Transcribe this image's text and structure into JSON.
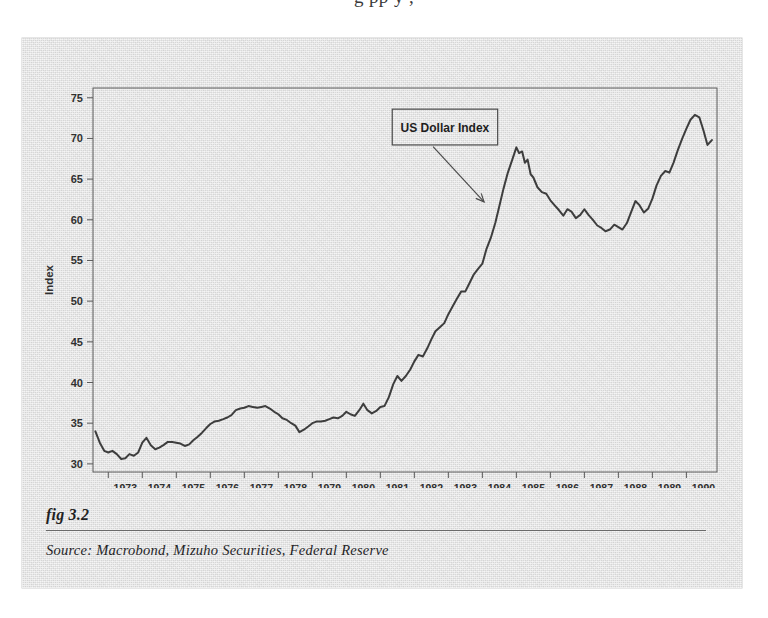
{
  "page": {
    "top_text_fragment": "g           pp y        ,"
  },
  "figure": {
    "fig_number": "fig 3.2",
    "source": "Source:  Macrobond, Mizuho Securities, Federal Reserve"
  },
  "chart_data": {
    "type": "line",
    "title": "",
    "annotation": {
      "label": "US Dollar Index",
      "box_x": 1981.35,
      "box_y_top": 73.6,
      "box_y_bottom": 69.2,
      "box_x_end": 1984.45,
      "arrow_from_x": 1982.55,
      "arrow_from_y": 69.0,
      "arrow_to_x": 1984.05,
      "arrow_to_y": 62.2
    },
    "xlabel": "",
    "ylabel": "Index",
    "xlim": [
      1972.55,
      1990.9
    ],
    "ylim": [
      29.0,
      76.2
    ],
    "yticks": [
      30,
      35,
      40,
      45,
      50,
      55,
      60,
      65,
      70,
      75
    ],
    "xticks": [
      1973,
      1974,
      1975,
      1976,
      1977,
      1978,
      1979,
      1980,
      1981,
      1982,
      1983,
      1984,
      1985,
      1986,
      1987,
      1988,
      1989,
      1990
    ],
    "grid": false,
    "legend": "none",
    "line_color": "#3c3c3c",
    "background_color": "#d9d9d9",
    "series": [
      {
        "name": "US Dollar Index",
        "x": [
          1972.62,
          1972.75,
          1972.88,
          1973.0,
          1973.12,
          1973.25,
          1973.38,
          1973.5,
          1973.62,
          1973.75,
          1973.88,
          1974.0,
          1974.12,
          1974.25,
          1974.38,
          1974.5,
          1974.62,
          1974.75,
          1974.88,
          1975.0,
          1975.12,
          1975.25,
          1975.38,
          1975.5,
          1975.62,
          1975.75,
          1975.88,
          1976.0,
          1976.12,
          1976.25,
          1976.38,
          1976.5,
          1976.62,
          1976.75,
          1976.88,
          1977.0,
          1977.12,
          1977.25,
          1977.38,
          1977.5,
          1977.62,
          1977.75,
          1977.88,
          1978.0,
          1978.12,
          1978.25,
          1978.38,
          1978.5,
          1978.62,
          1978.75,
          1978.88,
          1979.0,
          1979.12,
          1979.25,
          1979.38,
          1979.5,
          1979.62,
          1979.75,
          1979.88,
          1980.0,
          1980.12,
          1980.25,
          1980.38,
          1980.5,
          1980.62,
          1980.75,
          1980.88,
          1981.0,
          1981.12,
          1981.25,
          1981.38,
          1981.5,
          1981.62,
          1981.75,
          1981.88,
          1982.0,
          1982.12,
          1982.25,
          1982.38,
          1982.5,
          1982.62,
          1982.75,
          1982.88,
          1983.0,
          1983.12,
          1983.25,
          1983.38,
          1983.5,
          1983.62,
          1983.75,
          1983.88,
          1984.0,
          1984.12,
          1984.25,
          1984.38,
          1984.5,
          1984.62,
          1984.75,
          1984.88,
          1985.0,
          1985.08,
          1985.17,
          1985.25,
          1985.33,
          1985.42,
          1985.5,
          1985.62,
          1985.75,
          1985.88,
          1986.0,
          1986.12,
          1986.25,
          1986.38,
          1986.5,
          1986.62,
          1986.75,
          1986.88,
          1987.0,
          1987.12,
          1987.25,
          1987.38,
          1987.5,
          1987.62,
          1987.75,
          1987.88,
          1988.0,
          1988.12,
          1988.25,
          1988.38,
          1988.5,
          1988.62,
          1988.75,
          1988.88,
          1989.0,
          1989.12,
          1989.25,
          1989.38,
          1989.5,
          1989.62,
          1989.75,
          1989.88,
          1990.0,
          1990.12,
          1990.25,
          1990.38,
          1990.5,
          1990.62,
          1990.75
        ],
        "y": [
          34.0,
          32.6,
          31.6,
          31.4,
          31.6,
          31.2,
          30.6,
          30.7,
          31.2,
          31.0,
          31.4,
          32.6,
          33.2,
          32.3,
          31.8,
          32.0,
          32.3,
          32.7,
          32.7,
          32.6,
          32.5,
          32.2,
          32.4,
          32.9,
          33.3,
          33.8,
          34.4,
          34.9,
          35.2,
          35.3,
          35.5,
          35.7,
          36.0,
          36.6,
          36.8,
          36.9,
          37.1,
          37.0,
          36.9,
          37.0,
          37.1,
          36.8,
          36.4,
          36.1,
          35.6,
          35.4,
          35.0,
          34.7,
          33.9,
          34.2,
          34.6,
          35.0,
          35.2,
          35.2,
          35.3,
          35.5,
          35.7,
          35.6,
          35.9,
          36.4,
          36.1,
          35.9,
          36.6,
          37.4,
          36.6,
          36.2,
          36.5,
          37.0,
          37.1,
          38.2,
          39.8,
          40.8,
          40.2,
          40.8,
          41.6,
          42.6,
          43.4,
          43.2,
          44.2,
          45.3,
          46.3,
          46.8,
          47.3,
          48.4,
          49.3,
          50.3,
          51.2,
          51.2,
          52.2,
          53.3,
          54.0,
          54.6,
          56.4,
          57.8,
          59.6,
          61.7,
          63.8,
          65.8,
          67.4,
          68.9,
          68.2,
          68.4,
          67.0,
          67.4,
          65.6,
          65.2,
          64.0,
          63.4,
          63.2,
          62.4,
          61.8,
          61.2,
          60.5,
          61.3,
          61.0,
          60.2,
          60.6,
          61.3,
          60.6,
          60.0,
          59.3,
          59.0,
          58.6,
          58.8,
          59.4,
          59.1,
          58.8,
          59.6,
          61.0,
          62.3,
          61.8,
          60.9,
          61.4,
          62.6,
          64.2,
          65.4,
          66.0,
          65.8,
          67.0,
          68.6,
          70.0,
          71.2,
          72.3,
          72.9,
          72.6,
          71.0,
          69.2,
          69.8
        ]
      }
    ]
  }
}
